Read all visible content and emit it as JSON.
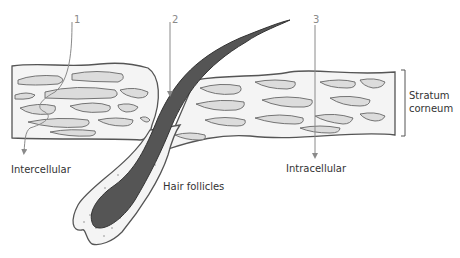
{
  "labels": {
    "route_1": "1",
    "route_2": "2",
    "route_3": "3",
    "intercellular": "Intercellular",
    "hair_follicles": "Hair follicles",
    "intracellular": "Intracellular",
    "stratum_line1": "Stratum",
    "stratum_line2": "corneum"
  },
  "colors": {
    "outline": "#555555",
    "layer_fill": "#f4f4f4",
    "cell_fill": "#dcdcdc",
    "hair_fill": "#555555",
    "arrow": "#8a8a8a"
  }
}
